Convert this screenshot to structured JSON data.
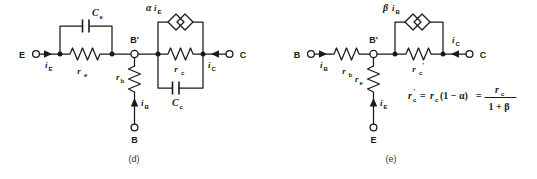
{
  "figure": {
    "ink_color": "#1a1a1a",
    "background_color": "#ffffff"
  },
  "panels": [
    {
      "id": "d",
      "caption": "(d)",
      "terminals": [
        {
          "name": "emitter",
          "label": "E"
        },
        {
          "name": "base",
          "label": "B"
        },
        {
          "name": "collector",
          "label": "C"
        },
        {
          "name": "internal-base",
          "label": "B'"
        }
      ],
      "currents": [
        {
          "name": "emitter-current",
          "symbol": "i",
          "sub": "E"
        },
        {
          "name": "base-current",
          "symbol": "i",
          "sub": "B"
        },
        {
          "name": "collector-current",
          "symbol": "i",
          "sub": "C"
        }
      ],
      "components": [
        {
          "name": "emitter-resistor",
          "symbol": "r",
          "sub": "e",
          "type": "resistor"
        },
        {
          "name": "emitter-capacitor",
          "symbol": "C",
          "sub": "e",
          "type": "capacitor"
        },
        {
          "name": "base-resistor",
          "symbol": "r",
          "sub": "b",
          "type": "resistor"
        },
        {
          "name": "collector-resistor",
          "symbol": "r",
          "sub": "c",
          "type": "resistor"
        },
        {
          "name": "collector-capacitor",
          "symbol": "C",
          "sub": "c",
          "type": "capacitor"
        },
        {
          "name": "dependent-current-source",
          "symbol": "αi",
          "sub": "E",
          "type": "dependent-source"
        }
      ]
    },
    {
      "id": "e",
      "caption": "(e)",
      "terminals": [
        {
          "name": "base",
          "label": "B"
        },
        {
          "name": "emitter",
          "label": "E"
        },
        {
          "name": "collector",
          "label": "C"
        },
        {
          "name": "internal-base",
          "label": "B'"
        }
      ],
      "currents": [
        {
          "name": "base-current",
          "symbol": "i",
          "sub": "B"
        },
        {
          "name": "emitter-current",
          "symbol": "i",
          "sub": "E"
        },
        {
          "name": "collector-current",
          "symbol": "i",
          "sub": "C"
        }
      ],
      "components": [
        {
          "name": "base-resistor",
          "symbol": "r",
          "sub": "b",
          "type": "resistor"
        },
        {
          "name": "emitter-resistor",
          "symbol": "r",
          "sub": "e",
          "type": "resistor"
        },
        {
          "name": "collector-resistor-prime",
          "symbol": "r",
          "sub": "c",
          "prime": "'",
          "type": "resistor"
        },
        {
          "name": "dependent-current-source",
          "symbol": "βi",
          "sub": "B",
          "type": "dependent-source"
        }
      ],
      "equation": {
        "lhs_symbol": "r",
        "lhs_sub": "c",
        "lhs_prime": "'",
        "eq1": "=",
        "mid_symbol": "r",
        "mid_sub": "c",
        "mid_factor": "(1 − α)",
        "eq2": "=",
        "numer_symbol": "r",
        "numer_sub": "c",
        "denom": "1 + β"
      }
    }
  ]
}
